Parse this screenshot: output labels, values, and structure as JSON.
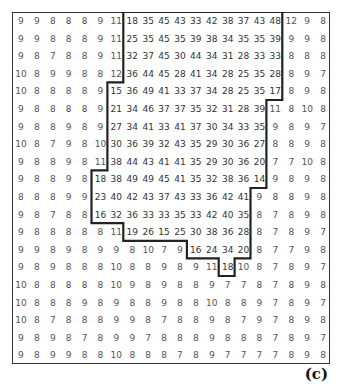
{
  "figure": {
    "label": "(c)",
    "rows": 20,
    "cols": 20,
    "grid": [
      [
        9,
        9,
        8,
        8,
        8,
        9,
        11,
        18,
        35,
        45,
        43,
        33,
        42,
        38,
        37,
        43,
        48,
        12,
        9,
        8
      ],
      [
        9,
        9,
        8,
        8,
        8,
        9,
        11,
        25,
        35,
        45,
        35,
        39,
        38,
        34,
        35,
        35,
        39,
        9,
        9,
        8
      ],
      [
        9,
        8,
        7,
        8,
        8,
        9,
        11,
        32,
        37,
        45,
        30,
        44,
        34,
        31,
        28,
        33,
        33,
        8,
        8,
        8
      ],
      [
        10,
        8,
        9,
        9,
        8,
        8,
        12,
        36,
        44,
        45,
        28,
        41,
        34,
        28,
        25,
        35,
        28,
        8,
        9,
        7
      ],
      [
        10,
        8,
        8,
        8,
        8,
        9,
        15,
        36,
        49,
        41,
        33,
        37,
        34,
        28,
        25,
        35,
        17,
        8,
        9,
        8
      ],
      [
        9,
        8,
        8,
        8,
        8,
        9,
        21,
        34,
        46,
        37,
        37,
        35,
        32,
        31,
        28,
        39,
        11,
        8,
        10,
        8
      ],
      [
        9,
        8,
        8,
        9,
        8,
        9,
        27,
        34,
        41,
        33,
        41,
        37,
        30,
        34,
        33,
        35,
        9,
        8,
        9,
        7
      ],
      [
        10,
        8,
        7,
        9,
        8,
        10,
        30,
        36,
        39,
        32,
        43,
        35,
        29,
        30,
        36,
        27,
        8,
        8,
        9,
        8
      ],
      [
        9,
        8,
        8,
        9,
        8,
        11,
        38,
        44,
        43,
        41,
        41,
        35,
        29,
        30,
        36,
        20,
        7,
        7,
        10,
        8
      ],
      [
        9,
        8,
        8,
        9,
        8,
        18,
        38,
        49,
        49,
        45,
        41,
        35,
        32,
        38,
        36,
        14,
        9,
        8,
        9,
        8
      ],
      [
        8,
        8,
        8,
        9,
        9,
        23,
        40,
        42,
        43,
        37,
        43,
        33,
        36,
        42,
        41,
        9,
        8,
        8,
        9,
        8
      ],
      [
        9,
        8,
        7,
        8,
        8,
        16,
        32,
        36,
        33,
        33,
        35,
        33,
        42,
        40,
        35,
        8,
        7,
        8,
        9,
        8
      ],
      [
        9,
        8,
        8,
        8,
        8,
        8,
        11,
        19,
        26,
        15,
        25,
        30,
        38,
        36,
        28,
        8,
        7,
        8,
        9,
        7
      ],
      [
        9,
        9,
        8,
        9,
        8,
        9,
        9,
        8,
        10,
        7,
        9,
        16,
        24,
        34,
        20,
        8,
        7,
        7,
        9,
        8
      ],
      [
        9,
        8,
        9,
        8,
        8,
        8,
        10,
        8,
        8,
        9,
        8,
        9,
        11,
        18,
        10,
        8,
        7,
        8,
        9,
        7
      ],
      [
        10,
        8,
        8,
        8,
        8,
        8,
        10,
        9,
        8,
        9,
        8,
        8,
        9,
        7,
        7,
        8,
        7,
        8,
        9,
        8
      ],
      [
        10,
        8,
        8,
        8,
        9,
        8,
        9,
        8,
        8,
        9,
        8,
        8,
        10,
        8,
        8,
        9,
        7,
        8,
        9,
        7
      ],
      [
        10,
        8,
        7,
        8,
        8,
        8,
        9,
        9,
        8,
        7,
        8,
        8,
        9,
        8,
        7,
        9,
        7,
        8,
        9,
        8
      ],
      [
        9,
        8,
        9,
        8,
        7,
        8,
        9,
        9,
        7,
        8,
        8,
        8,
        9,
        8,
        8,
        8,
        7,
        8,
        9,
        7
      ],
      [
        9,
        8,
        9,
        9,
        8,
        8,
        10,
        8,
        8,
        8,
        7,
        8,
        9,
        7,
        7,
        7,
        7,
        8,
        9,
        8
      ]
    ],
    "region_bounds": [
      [
        7,
        17
      ],
      [
        7,
        17
      ],
      [
        7,
        17
      ],
      [
        7,
        17
      ],
      [
        6,
        17
      ],
      [
        6,
        16
      ],
      [
        6,
        16
      ],
      [
        6,
        16
      ],
      [
        6,
        16
      ],
      [
        5,
        16
      ],
      [
        5,
        15
      ],
      [
        5,
        15
      ],
      [
        7,
        15
      ],
      [
        11,
        15
      ],
      [
        13,
        14
      ]
    ],
    "colors": {
      "border": "#222222",
      "text": "#555555",
      "label": "#111111"
    }
  }
}
